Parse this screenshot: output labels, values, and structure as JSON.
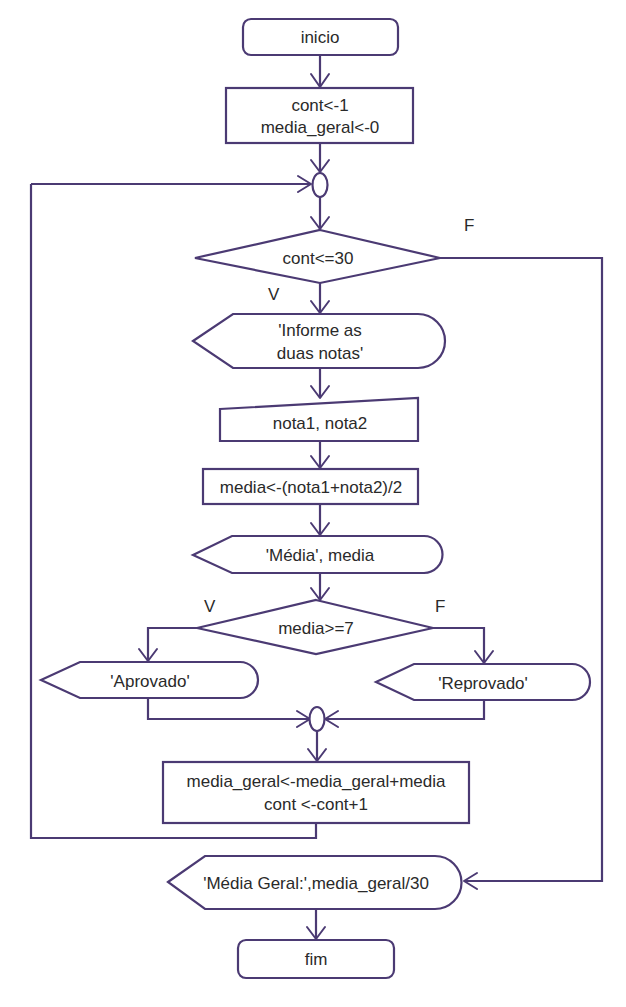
{
  "flowchart": {
    "theme": {
      "stroke_color": "#4b3a73",
      "text_color": "#2a2a2a",
      "background": "#ffffff"
    },
    "nodes": {
      "start": {
        "type": "terminator",
        "text": "inicio"
      },
      "init": {
        "type": "process",
        "line1": "cont<-1",
        "line2": "media_geral<-0"
      },
      "loop_connector": {
        "type": "connector"
      },
      "loop_condition": {
        "type": "decision",
        "text": "cont<=30",
        "true_label": "V",
        "false_label": "F"
      },
      "prompt": {
        "type": "display",
        "line1": "'Informe as",
        "line2": "duas notas'"
      },
      "read": {
        "type": "manual-input",
        "text": "nota1, nota2"
      },
      "compute": {
        "type": "process",
        "text": "media<-(nota1+nota2)/2"
      },
      "show_media": {
        "type": "display",
        "text": "'Média', media"
      },
      "grade_condition": {
        "type": "decision",
        "text": "media>=7",
        "true_label": "V",
        "false_label": "F"
      },
      "approved": {
        "type": "display",
        "text": "'Aprovado'"
      },
      "failed": {
        "type": "display",
        "text": "'Reprovado'"
      },
      "merge_connector": {
        "type": "connector"
      },
      "accumulate": {
        "type": "process",
        "line1": "media_geral<-media_geral+media",
        "line2": "cont <-cont+1"
      },
      "show_total": {
        "type": "display",
        "text": "'Média Geral:',media_geral/30"
      },
      "end": {
        "type": "terminator",
        "text": "fim"
      }
    }
  }
}
